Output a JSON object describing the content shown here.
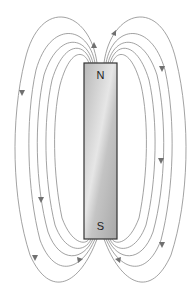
{
  "diagram": {
    "magnet": {
      "north_label": "N",
      "south_label": "S",
      "x": 84,
      "y": 63,
      "width": 33,
      "height": 176,
      "border_color": "#333333",
      "fill_color": "#c8c8c8"
    },
    "field_line_color": "#8a8a8a",
    "arrow_color": "#707070",
    "field_lines_per_side": 5
  }
}
